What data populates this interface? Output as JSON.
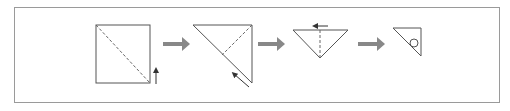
{
  "diagram": {
    "title": "",
    "colors": {
      "frame": "#9a9a9a",
      "line": "#555555",
      "step_arrow": "#888888",
      "background": "#ffffff"
    },
    "steps": [
      {
        "id": 1,
        "shape": "square-with-dashed-diagonal",
        "direction_arrow": "up"
      },
      {
        "id": 2,
        "shape": "triangle-folded-with-dashed-line",
        "direction_arrow": "up-left"
      },
      {
        "id": 3,
        "shape": "inverted-triangle-with-dashed-center",
        "direction_arrow": "left"
      },
      {
        "id": 4,
        "shape": "small-triangle-with-circle",
        "direction_arrow": null
      }
    ],
    "step_arrow_icon": "right-arrow-icon"
  }
}
